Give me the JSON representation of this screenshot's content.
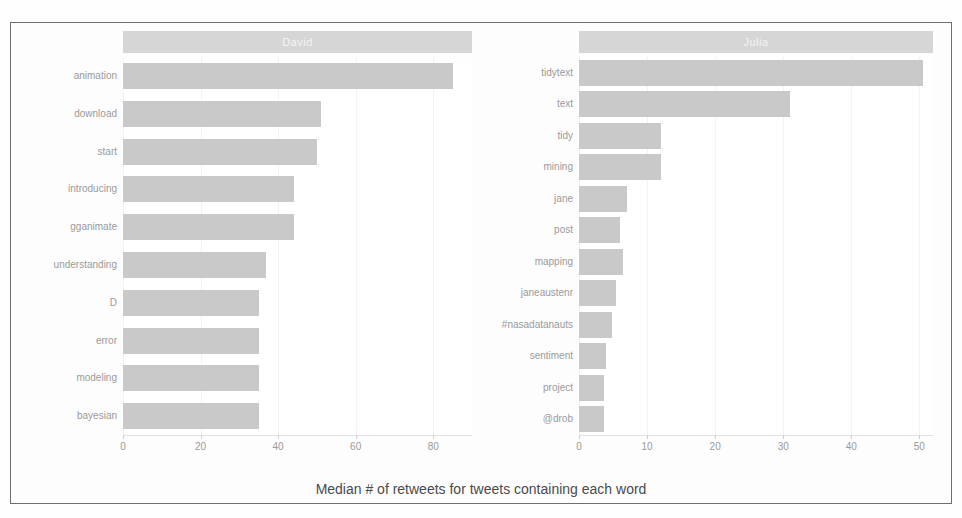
{
  "figure": {
    "axis_caption": "Median # of retweets for tweets containing each word",
    "bar_color": "#c9c9c9",
    "strip_color": "#d6d6d6",
    "strip_text_color": "#f4f4f4",
    "label_color": "#9a9a9a",
    "border_color": "#6e6e6e"
  },
  "chart_data": {
    "type": "bar",
    "orientation": "horizontal",
    "title": "",
    "xlabel": "Median # of retweets for tweets containing each word",
    "ylabel": "",
    "grid": false,
    "legend": "none",
    "facets": [
      {
        "name": "David",
        "categories": [
          "animation",
          "download",
          "start",
          "introducing",
          "gganimate",
          "understanding",
          "D",
          "error",
          "modeling",
          "bayesian"
        ],
        "values": [
          85,
          51,
          50,
          44,
          44,
          37,
          35,
          35,
          35,
          35
        ],
        "xlim": [
          0,
          90
        ],
        "xticks": [
          0,
          20,
          40,
          60,
          80
        ]
      },
      {
        "name": "Julia",
        "categories": [
          "tidytext",
          "text",
          "tidy",
          "mining",
          "jane",
          "post",
          "mapping",
          "janeaustenr",
          "#nasadatanauts",
          "sentiment",
          "project",
          "@drob"
        ],
        "values": [
          50.5,
          31,
          12,
          12,
          7,
          6,
          6.5,
          5.5,
          4.8,
          3.9,
          3.7,
          3.7
        ],
        "xlim": [
          0,
          52
        ],
        "xticks": [
          0,
          10,
          20,
          30,
          40,
          50
        ]
      }
    ]
  }
}
